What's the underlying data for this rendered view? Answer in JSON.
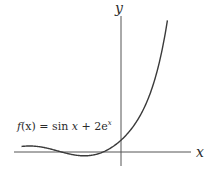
{
  "chart_data": {
    "type": "line",
    "title": "",
    "xlabel": "x",
    "ylabel": "y",
    "annotations": [
      {
        "text": "f(x) = sin x + 2e^x",
        "position": "left, just above x-axis"
      }
    ],
    "series": [
      {
        "name": "f(x) = sin x + 2e^x",
        "function": "sin(x) + 2*exp(x)",
        "x_range": [
          -5.1,
          2.38
        ],
        "sample_points": [
          {
            "x": -5.0,
            "y": 0.97
          },
          {
            "x": -4.0,
            "y": 0.79
          },
          {
            "x": -3.0,
            "y": -0.04
          },
          {
            "x": -2.0,
            "y": -0.64
          },
          {
            "x": -1.0,
            "y": -0.11
          },
          {
            "x": 0.0,
            "y": 2.0
          },
          {
            "x": 1.0,
            "y": 6.28
          },
          {
            "x": 2.0,
            "y": 15.69
          },
          {
            "x": 2.35,
            "y": 21.68
          }
        ]
      }
    ],
    "grid": false,
    "legend": "none",
    "axes": {
      "ticks": "none",
      "origin_marked": false
    },
    "colors": {
      "curve": "#3a3a3a",
      "axes": "#555555",
      "text": "#2b2b2b"
    }
  },
  "labels": {
    "x_axis": "x",
    "y_axis": "y",
    "fn_prefix": "f",
    "fn_arg": "(x) = sin ",
    "fn_x": "x",
    "fn_plus": " + 2e",
    "fn_exp": "x"
  }
}
